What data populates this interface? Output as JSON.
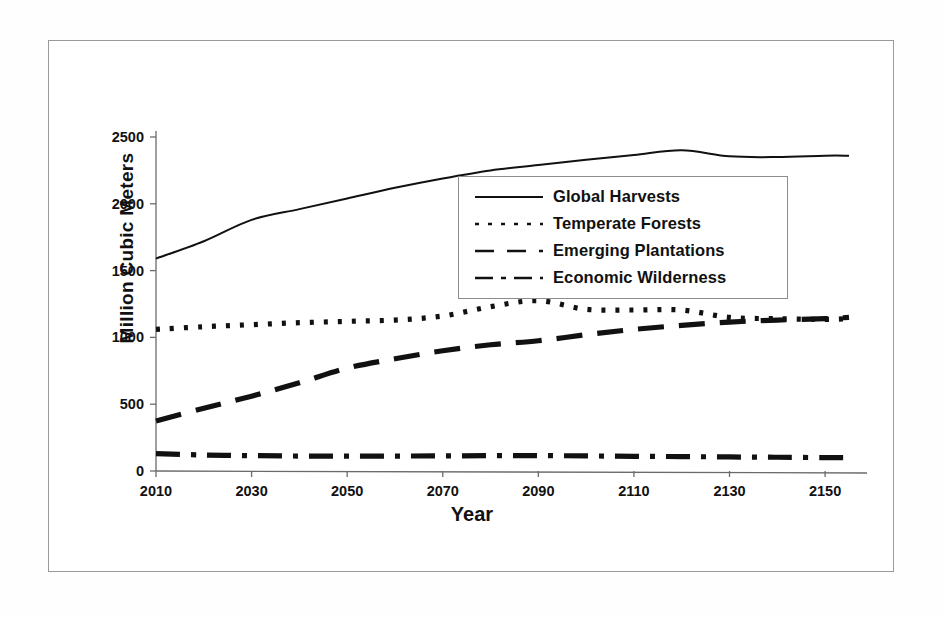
{
  "chart_data": {
    "type": "line",
    "title": "",
    "xlabel": "Year",
    "ylabel": "Million Cubic Meters",
    "xlim": [
      2010,
      2155
    ],
    "ylim": [
      0,
      2500
    ],
    "xticks": [
      "2010",
      "2030",
      "2050",
      "2070",
      "2090",
      "2110",
      "2130",
      "2150"
    ],
    "yticks": [
      "0",
      "500",
      "1000",
      "1500",
      "2000",
      "2500"
    ],
    "grid": false,
    "legend_position": "center",
    "x": [
      2010,
      2020,
      2030,
      2040,
      2050,
      2060,
      2070,
      2080,
      2090,
      2100,
      2110,
      2120,
      2130,
      2140,
      2150,
      2155
    ],
    "series": [
      {
        "name": "Global Harvests",
        "style": "solid",
        "values": [
          1590,
          1720,
          1880,
          1960,
          2040,
          2120,
          2190,
          2250,
          2290,
          2330,
          2365,
          2400,
          2355,
          2350,
          2360,
          2360
        ]
      },
      {
        "name": "Temperate Forests",
        "style": "dotted",
        "values": [
          1060,
          1080,
          1095,
          1110,
          1120,
          1130,
          1160,
          1230,
          1275,
          1210,
          1205,
          1205,
          1150,
          1140,
          1135,
          1140
        ]
      },
      {
        "name": "Emerging Plantations",
        "style": "dashed",
        "values": [
          375,
          470,
          560,
          660,
          770,
          840,
          900,
          945,
          975,
          1020,
          1060,
          1090,
          1115,
          1130,
          1140,
          1150
        ]
      },
      {
        "name": "Economic Wilderness",
        "style": "dashdot",
        "values": [
          130,
          120,
          115,
          112,
          112,
          112,
          113,
          115,
          115,
          113,
          110,
          108,
          105,
          103,
          100,
          100
        ]
      }
    ]
  },
  "legend": {
    "entries": [
      {
        "label": "Global Harvests",
        "swatch": "solid-line-icon"
      },
      {
        "label": "Temperate Forests",
        "swatch": "dotted-line-icon"
      },
      {
        "label": "Emerging Plantations",
        "swatch": "dashed-line-icon"
      },
      {
        "label": "Economic Wilderness",
        "swatch": "dashdot-line-icon"
      }
    ]
  }
}
